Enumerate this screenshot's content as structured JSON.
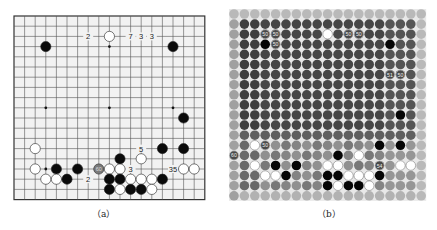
{
  "figure": {
    "panels": [
      {
        "id": "a",
        "caption": "（a）",
        "type": "go-board",
        "size": 19,
        "stones": [
          {
            "color": "white",
            "col": 9,
            "row": 2
          },
          {
            "color": "black",
            "col": 3,
            "row": 3
          },
          {
            "color": "black",
            "col": 15,
            "row": 3
          },
          {
            "color": "black",
            "col": 16,
            "row": 10
          },
          {
            "color": "white",
            "col": 2,
            "row": 13
          },
          {
            "color": "black",
            "col": 14,
            "row": 13
          },
          {
            "color": "black",
            "col": 16,
            "row": 13
          },
          {
            "color": "black",
            "col": 10,
            "row": 14
          },
          {
            "color": "white",
            "col": 12,
            "row": 14
          },
          {
            "color": "white",
            "col": 2,
            "row": 15
          },
          {
            "color": "black",
            "col": 4,
            "row": 15
          },
          {
            "color": "black",
            "col": 6,
            "row": 15
          },
          {
            "color": "gray",
            "col": 8,
            "row": 15,
            "label": "60"
          },
          {
            "color": "white",
            "col": 9,
            "row": 15
          },
          {
            "color": "white",
            "col": 10,
            "row": 15
          },
          {
            "color": "white",
            "col": 16,
            "row": 15
          },
          {
            "color": "white",
            "col": 17,
            "row": 15
          },
          {
            "color": "white",
            "col": 3,
            "row": 16
          },
          {
            "color": "white",
            "col": 4,
            "row": 16
          },
          {
            "color": "black",
            "col": 5,
            "row": 16
          },
          {
            "color": "black",
            "col": 9,
            "row": 16
          },
          {
            "color": "black",
            "col": 10,
            "row": 16
          },
          {
            "color": "white",
            "col": 11,
            "row": 16
          },
          {
            "color": "white",
            "col": 12,
            "row": 16
          },
          {
            "color": "white",
            "col": 13,
            "row": 16
          },
          {
            "color": "black",
            "col": 14,
            "row": 16
          },
          {
            "color": "black",
            "col": 9,
            "row": 17
          },
          {
            "color": "white",
            "col": 10,
            "row": 17
          },
          {
            "color": "black",
            "col": 11,
            "row": 17
          },
          {
            "color": "black",
            "col": 12,
            "row": 17
          },
          {
            "color": "white",
            "col": 13,
            "row": 17
          }
        ],
        "labels": [
          {
            "text": "2",
            "col": 7,
            "row": 2
          },
          {
            "text": "7",
            "col": 11,
            "row": 2
          },
          {
            "text": "3",
            "col": 12,
            "row": 2
          },
          {
            "text": "3",
            "col": 13,
            "row": 2
          },
          {
            "text": "5",
            "col": 12,
            "row": 13
          },
          {
            "text": "3",
            "col": 11,
            "row": 15
          },
          {
            "text": "35",
            "col": 15,
            "row": 15
          },
          {
            "text": "2",
            "col": 7,
            "row": 16
          }
        ],
        "dots": [
          {
            "col": 9,
            "row": 3
          },
          {
            "col": 3,
            "row": 9
          },
          {
            "col": 9,
            "row": 9
          },
          {
            "col": 15,
            "row": 9
          },
          {
            "col": 3,
            "row": 15
          }
        ]
      },
      {
        "id": "b",
        "caption": "（b）",
        "type": "go-heatmap",
        "size": 19,
        "stones": [
          {
            "color": "white",
            "col": 9,
            "row": 2
          },
          {
            "color": "black",
            "col": 3,
            "row": 3
          },
          {
            "color": "black",
            "col": 15,
            "row": 3
          },
          {
            "color": "black",
            "col": 16,
            "row": 10
          },
          {
            "color": "white",
            "col": 2,
            "row": 13
          },
          {
            "color": "black",
            "col": 14,
            "row": 13
          },
          {
            "color": "black",
            "col": 16,
            "row": 13
          },
          {
            "color": "black",
            "col": 10,
            "row": 14
          },
          {
            "color": "white",
            "col": 12,
            "row": 14
          },
          {
            "color": "white",
            "col": 2,
            "row": 15
          },
          {
            "color": "black",
            "col": 4,
            "row": 15
          },
          {
            "color": "black",
            "col": 6,
            "row": 15
          },
          {
            "color": "white",
            "col": 9,
            "row": 15
          },
          {
            "color": "white",
            "col": 10,
            "row": 15
          },
          {
            "color": "white",
            "col": 16,
            "row": 15
          },
          {
            "color": "white",
            "col": 17,
            "row": 15
          },
          {
            "color": "white",
            "col": 3,
            "row": 16
          },
          {
            "color": "white",
            "col": 4,
            "row": 16
          },
          {
            "color": "black",
            "col": 5,
            "row": 16
          },
          {
            "color": "black",
            "col": 9,
            "row": 16
          },
          {
            "color": "black",
            "col": 10,
            "row": 16
          },
          {
            "color": "white",
            "col": 11,
            "row": 16
          },
          {
            "color": "white",
            "col": 12,
            "row": 16
          },
          {
            "color": "white",
            "col": 13,
            "row": 16
          },
          {
            "color": "black",
            "col": 14,
            "row": 16
          },
          {
            "color": "black",
            "col": 9,
            "row": 17
          },
          {
            "color": "white",
            "col": 10,
            "row": 17
          },
          {
            "color": "black",
            "col": 11,
            "row": 17
          },
          {
            "color": "black",
            "col": 12,
            "row": 17
          },
          {
            "color": "white",
            "col": 13,
            "row": 17
          }
        ],
        "value_labels": [
          {
            "text": "50",
            "col": 3,
            "row": 2
          },
          {
            "text": "50",
            "col": 4,
            "row": 2
          },
          {
            "text": "50",
            "col": 4,
            "row": 3
          },
          {
            "text": "50",
            "col": 11,
            "row": 2
          },
          {
            "text": "50",
            "col": 12,
            "row": 2
          },
          {
            "text": "51",
            "col": 15,
            "row": 6
          },
          {
            "text": "50",
            "col": 16,
            "row": 6
          },
          {
            "text": "50",
            "col": 3,
            "row": 13
          },
          {
            "text": "60",
            "col": 0,
            "row": 14
          },
          {
            "text": "54",
            "col": 14,
            "row": 15
          }
        ],
        "colors": {
          "dark": "#3a3a3a",
          "mid": "#6e6e6e",
          "light": "#a8a8a8",
          "edge": "#c4c4c4"
        }
      }
    ]
  }
}
